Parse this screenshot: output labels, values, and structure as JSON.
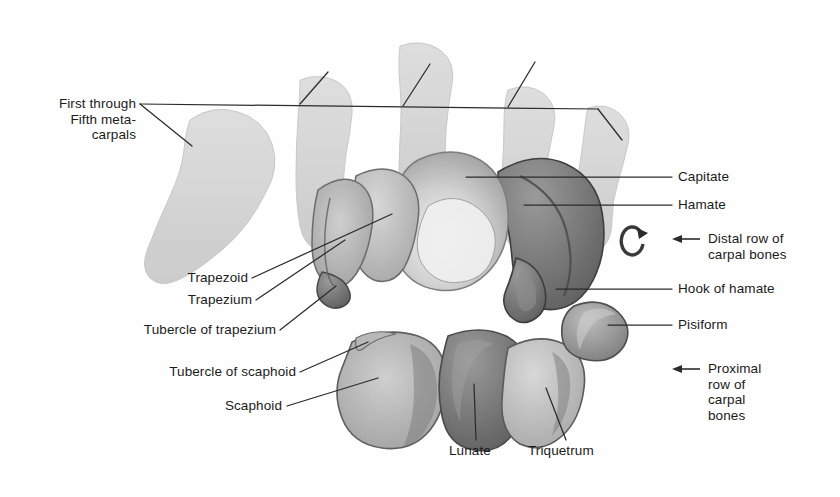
{
  "figure": {
    "background_color": "#fefefe",
    "ink_color": "#1b1b1b"
  },
  "labels": {
    "metacarpals": "First through\nFifth meta-\ncarpals",
    "capitate": "Capitate",
    "hamate": "Hamate",
    "distal_row": "Distal row of\ncarpal bones",
    "hook_of_hamate": "Hook of hamate",
    "pisiform": "Pisiform",
    "proximal_row": "Proximal\nrow of\ncarpal\nbones",
    "trapezoid": "Trapezoid",
    "trapezium": "Trapezium",
    "tubercle_of_trapezium": "Tubercle of trapezium",
    "tubercle_of_scaphoid": "Tubercle of scaphoid",
    "scaphoid": "Scaphoid",
    "lunate": "Lunate",
    "triquetrum": "Triquetrum"
  },
  "structures": {
    "metacarpal_1": "first-metacarpal",
    "metacarpal_2": "second-metacarpal",
    "metacarpal_3": "third-metacarpal",
    "metacarpal_4": "fourth-metacarpal",
    "metacarpal_5": "fifth-metacarpal",
    "capitate": "capitate-bone",
    "hamate": "hamate-bone",
    "hook": "hook-of-hamate",
    "trapezium": "trapezium-bone",
    "trapezoid": "trapezoid-bone",
    "scaphoid": "scaphoid-bone",
    "lunate": "lunate-bone",
    "triquetrum": "triquetrum-bone",
    "pisiform": "pisiform-bone"
  },
  "markers": {
    "rotation_glyph": "curved-rotation-arrow",
    "distal_arrow": "left-arrow",
    "proximal_arrow": "left-arrow"
  }
}
